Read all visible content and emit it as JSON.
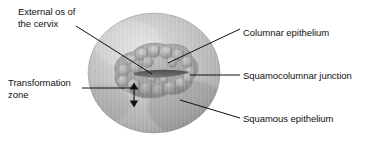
{
  "figure": {
    "background_color": "#ffffff",
    "line_color": "#111111"
  },
  "labels": {
    "external_os": "External os of\nthe cervix",
    "transformation_zone": "Transformation\nzone",
    "columnar_epithelium": "Columnar epithelium",
    "squamocolumnar_junction": "Squamocolumnar junction",
    "squamous_epithelium": "Squamous epithelium"
  },
  "anatomy": {
    "cervix_disc": {
      "name": "cervix-disc",
      "fill_light": "#cfcfcf",
      "fill_mid": "#b4b4b4",
      "fill_dark": "#8f8f8f"
    },
    "ectropion": {
      "name": "columnar-epithelium-region",
      "fill_light": "#b0b0b0",
      "fill_mid": "#989898",
      "fill_dark": "#6f6f6f"
    },
    "os_slit": {
      "name": "external-os-slit",
      "fill": "#5a5a5a"
    }
  }
}
